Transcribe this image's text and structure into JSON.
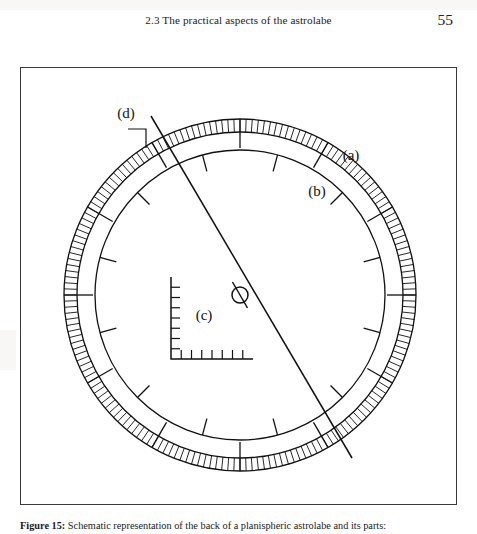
{
  "page": {
    "running_head": "2.3 The practical aspects of the astrolabe",
    "page_number": "55"
  },
  "figure": {
    "caption_label": "Figure 15:",
    "caption_text": " Schematic representation of the back of a planispheric astrolabe and its parts:",
    "labels": {
      "a": "(a)",
      "b": "(b)",
      "c": "(c)",
      "d": "(d)"
    }
  },
  "chart_data": {
    "type": "diagram",
    "title": "Schematic representation of the back of a planispheric astrolabe",
    "center": {
      "x": 219,
      "y": 227
    },
    "parts": [
      {
        "key": "a",
        "label": "(a)",
        "name": "degree-scale-outer-limb",
        "label_pos": {
          "x": 330,
          "y": 85
        },
        "geometry": {
          "shape": "annulus",
          "r_outer": 176,
          "r_inner": 163,
          "minor_ticks": 180,
          "major_ticks": 12
        }
      },
      {
        "key": "b",
        "label": "(b)",
        "name": "inner-graduated-circle",
        "label_pos": {
          "x": 296,
          "y": 122
        },
        "leader": {
          "x1": 318,
          "y1": 133,
          "x2": 303,
          "y2": 148
        },
        "geometry": {
          "shape": "circle",
          "r": 145,
          "tick_count": 12,
          "tick_length": 17
        }
      },
      {
        "key": "c",
        "label": "(c)",
        "name": "shadow-square",
        "label_pos": {
          "x": 180,
          "y": 237
        },
        "geometry": {
          "shape": "L-scale",
          "origin": {
            "x": 150,
            "y": 291
          },
          "arm": 82,
          "divisions": 7
        }
      },
      {
        "key": "d",
        "label": "(d)",
        "name": "alidade",
        "label_pos": {
          "x": 104,
          "y": 45
        },
        "leader": {
          "x1": 110,
          "y1": 60,
          "x2": 128,
          "y2": 78
        },
        "geometry": {
          "shape": "line",
          "x1": 130,
          "y1": 48,
          "x2": 331,
          "y2": 390,
          "angle_deg": 300
        }
      }
    ],
    "axis_ranges": {
      "x": [
        0,
        437
      ],
      "y": [
        0,
        438
      ]
    },
    "grid": false,
    "legend": "none"
  }
}
